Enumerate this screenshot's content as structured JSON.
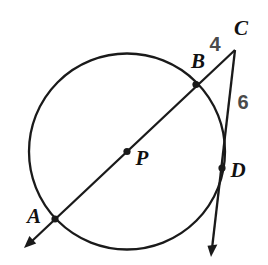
{
  "diagram": {
    "points": {
      "a": "A",
      "b": "B",
      "c": "C",
      "d": "D",
      "p": "P"
    },
    "measurements": {
      "bc_length": "4",
      "cd_length": "6"
    },
    "colors": {
      "line": "#1a1a1a",
      "number_text": "#4a4a4a",
      "letter_text": "#111111",
      "background": "#ffffff"
    }
  }
}
